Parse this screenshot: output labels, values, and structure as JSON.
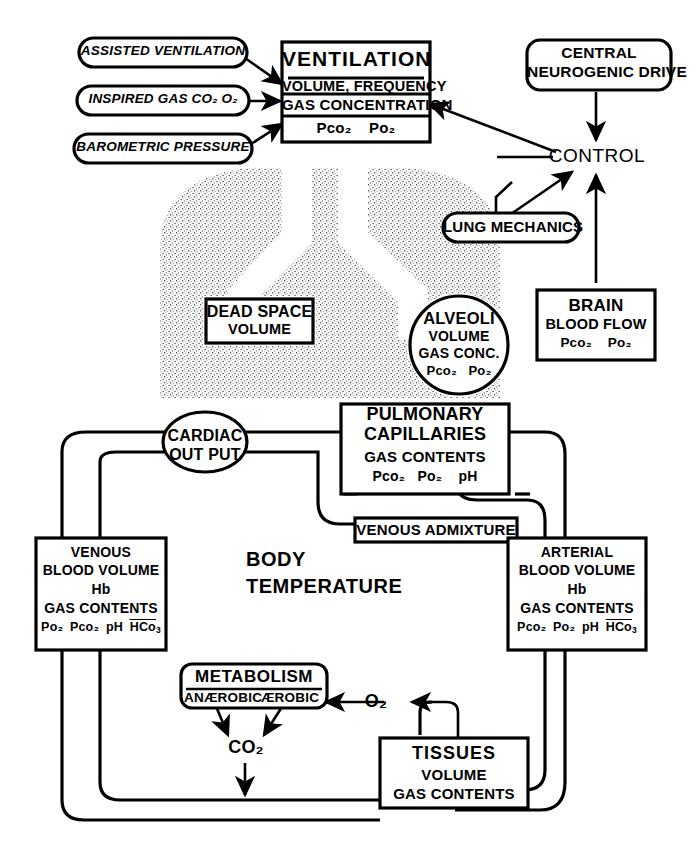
{
  "diagram": {
    "ink_color": "#000000",
    "background_color": "#ffffff",
    "stipple_color": "#6e6e6e"
  },
  "inputs": [
    {
      "id": "assisted-ventilation",
      "label": "ASSISTED  VENTILATION",
      "shape": "rounded-oval",
      "style": "italic"
    },
    {
      "id": "inspired-gas",
      "label": "INSPIRED GAS   CO₂  O₂",
      "shape": "rounded-oval",
      "style": "italic"
    },
    {
      "id": "barometric-pressure",
      "label": "BAROMETRIC  PRESSURE",
      "shape": "rounded-oval",
      "style": "italic"
    }
  ],
  "ventilation_box": {
    "title": "VENTILATION",
    "line1": "VOLUME, FREQUENCY",
    "line2": "GAS CONCENTRATION",
    "line3_a": "Pco₂",
    "line3_b": "Po₂"
  },
  "central_drive": {
    "line1": "CENTRAL",
    "line2": "NEUROGENIC  DRIVE"
  },
  "control": {
    "label": "CONTROL"
  },
  "lung_mechanics": {
    "label": "LUNG MECHANICS"
  },
  "dead_space": {
    "line1": "DEAD SPACE",
    "line2": "VOLUME"
  },
  "alveoli": {
    "line1": "ALVEOLI",
    "line2": "VOLUME",
    "line3": "GAS CONC.",
    "line4_a": "Pco₂",
    "line4_b": "Po₂"
  },
  "brain": {
    "line1": "BRAIN",
    "line2": "BLOOD FLOW",
    "line3_a": "Pco₂",
    "line3_b": "Po₂"
  },
  "cardiac_output": {
    "line1": "CARDIAC",
    "line2": "OUT PUT"
  },
  "pulmonary_capillaries": {
    "line1": "PULMONARY",
    "line2": "CAPILLARIES",
    "line3": "GAS CONTENTS",
    "line4_a": "Pco₂",
    "line4_b": "Po₂",
    "line4_c": "pH"
  },
  "venous_admixture": {
    "label": "VENOUS ADMIXTURE"
  },
  "venous_blood": {
    "line1": "VENOUS",
    "line2": "BLOOD VOLUME",
    "line3": "Hb",
    "line4": "GAS CONTENTS",
    "line5_a": "Po₂",
    "line5_b": "Pco₂",
    "line5_c": "pH",
    "line5_d": "HCo",
    "line5_d_sub": "3",
    "line5_d_sup": "−"
  },
  "arterial_blood": {
    "line1": "ARTERIAL",
    "line2": "BLOOD VOLUME",
    "line3": "Hb",
    "line4": "GAS CONTENTS",
    "line5_a": "Pco₂",
    "line5_b": "Po₂",
    "line5_c": "pH",
    "line5_d": "HCo",
    "line5_d_sub": "3",
    "line5_d_sup": "−"
  },
  "body_temperature": {
    "line1": "BODY",
    "line2": "TEMPERATURE"
  },
  "metabolism": {
    "title": "METABOLISM",
    "left": "ANÆROBIC",
    "right": "ÆROBIC"
  },
  "gas_nodes": {
    "co2": "CO₂",
    "o2": "O₂"
  },
  "tissues": {
    "line1": "TISSUES",
    "line2": "VOLUME",
    "line3": "GAS CONTENTS"
  }
}
